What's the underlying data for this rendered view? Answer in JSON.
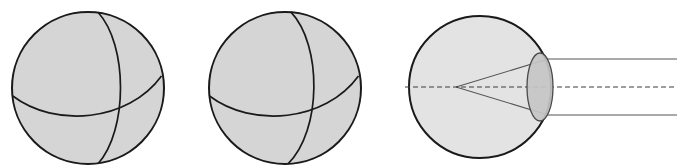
{
  "figure": {
    "width": 677,
    "height": 168,
    "background_color": "#ffffff"
  },
  "colors": {
    "sphere_fill": "#d5d5d5",
    "sphere_stroke": "#1a1a1a",
    "eye_fill": "#e3e3e3",
    "eye_stroke": "#1a1a1a",
    "lens_fill": "#c6c6c6",
    "lens_stroke": "#4a4a4a",
    "ray_stroke": "#555555",
    "axis_stroke": "#3c3c3c",
    "arc_stroke": "#1a1a1a"
  },
  "panels": [
    {
      "name": "sphere-left",
      "label": "Sphere with meridian and equator arcs (view 1)",
      "circle": {
        "cx": 88,
        "cy": 88,
        "r": 76
      },
      "arcs": [
        {
          "name": "meridian-arc",
          "label": "Vertical great-circle arc (meridian)",
          "path": "M 98 12.3 C 128 45 128 130 98 163.7"
        },
        {
          "name": "equator-arc",
          "label": "Horizontal great-circle arc (equator)",
          "path": "M 12.8 96 C 55 128 128 122 161.5 76"
        }
      ]
    },
    {
      "name": "sphere-right",
      "label": "Sphere with meridian and equator arcs (view 2)",
      "circle": {
        "cx": 285,
        "cy": 88,
        "r": 76
      },
      "arcs": [
        {
          "name": "meridian-arc",
          "label": "Vertical great-circle arc (meridian)",
          "path": "M 291 12.2 C 322 45 322 130 288 163.9"
        },
        {
          "name": "equator-arc",
          "label": "Horizontal great-circle arc (equator)",
          "path": "M 209.5 96 C 252 128 325 122 358.5 76"
        }
      ]
    },
    {
      "name": "eye-diagram",
      "label": "Schematic eye with lens, optical axis and converging rays",
      "circle": {
        "cx": 480,
        "cy": 87,
        "r": 71
      },
      "lens": {
        "name": "lens-ellipse",
        "label": "Crystalline lens",
        "cx": 540,
        "cy": 87,
        "rx": 13,
        "ry": 34
      },
      "optical_axis": {
        "name": "optical-axis",
        "label": "Dashed optical axis",
        "x1": 405,
        "y1": 87,
        "x2": 677,
        "y2": 87,
        "dash": "5 3"
      },
      "focal_point": {
        "x": 456,
        "y": 87
      },
      "rays": [
        {
          "name": "ray-upper",
          "label": "Upper light ray entering from the right and converging at the focal point",
          "path": "M 677 59 L 548 59 L 456 87"
        },
        {
          "name": "ray-lower",
          "label": "Lower light ray entering from the right and converging at the focal point",
          "path": "M 677 115 L 548 115 L 456 87"
        }
      ]
    }
  ]
}
